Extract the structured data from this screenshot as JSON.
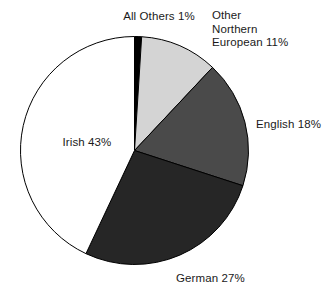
{
  "chart_data": {
    "type": "pie",
    "title": "",
    "subtitle": "",
    "xlabel": "",
    "ylabel": "",
    "legend_position": "none",
    "grid": false,
    "start_angle_deg": 0,
    "direction": "clockwise",
    "categories": [
      "All Others",
      "Other Northern European",
      "English",
      "German",
      "Irish"
    ],
    "values": [
      1,
      11,
      18,
      27,
      43
    ],
    "unit": "%",
    "total": 100,
    "slices": [
      {
        "name": "All Others",
        "value": 1,
        "label": "All Others 1%",
        "color": "#000000",
        "label_lines": [
          "All Others 1%"
        ]
      },
      {
        "name": "Other Northern European",
        "value": 11,
        "label": "Other Northern European 11%",
        "color": "#d4d4d4",
        "label_lines": [
          "Other",
          "Northern",
          "European 11%"
        ]
      },
      {
        "name": "English",
        "value": 18,
        "label": "English 18%",
        "color": "#4a4a4a",
        "label_lines": [
          "English 18%"
        ]
      },
      {
        "name": "German",
        "value": 27,
        "label": "German 27%",
        "color": "#262626",
        "label_lines": [
          "German 27%"
        ]
      },
      {
        "name": "Irish",
        "value": 43,
        "label": "Irish 43%",
        "color": "#ffffff",
        "label_lines": [
          "Irish 43%"
        ]
      }
    ]
  },
  "labels": {
    "all_others": "All Others 1%",
    "other_northern_european": "Other\nNorthern\nEuropean 11%",
    "english": "English 18%",
    "german": "German 27%",
    "irish": "Irish 43%"
  },
  "colors": {
    "background": "#ffffff",
    "outline": "#000000",
    "text": "#1a1a1a",
    "slice_all_others": "#000000",
    "slice_other_northern_european": "#d4d4d4",
    "slice_english": "#4a4a4a",
    "slice_german": "#262626",
    "slice_irish": "#ffffff"
  }
}
